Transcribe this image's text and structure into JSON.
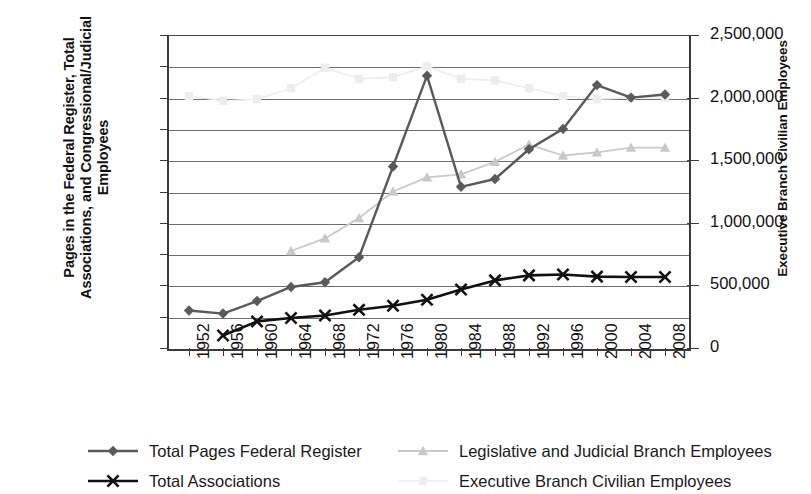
{
  "chart_data": {
    "type": "line",
    "title": "",
    "xlabel": "",
    "ylabel": "Pages in the Federal Register, Total Associations, and Congressional/Judicial Employees",
    "ylabel_right": "Executive Branch Civilian Employees",
    "x": [
      1952,
      1956,
      1960,
      1964,
      1968,
      1972,
      1976,
      1980,
      1984,
      1988,
      1992,
      1996,
      2000,
      2004,
      2008
    ],
    "xtick_labels": [
      "1952",
      "1956",
      "1960",
      "1964",
      "1968",
      "1972",
      "1976",
      "1980",
      "1984",
      "1988",
      "1992",
      "1996",
      "2000",
      "2004",
      "2008"
    ],
    "ylim": [
      0,
      100000
    ],
    "ytick_labels": [
      "0",
      "10,000",
      "20,000",
      "30,000",
      "40,000",
      "50,000",
      "60,000",
      "70,000",
      "80,000",
      "90,000",
      "100,000"
    ],
    "ytick_values": [
      0,
      10000,
      20000,
      30000,
      40000,
      50000,
      60000,
      70000,
      80000,
      90000,
      100000
    ],
    "ylim_right": [
      0,
      2500000
    ],
    "ytick_right_labels": [
      "0",
      "500,000",
      "1,000,000",
      "1,500,000",
      "2,000,000",
      "2,500,000"
    ],
    "ytick_right_values": [
      0,
      500000,
      1000000,
      1500000,
      2000000,
      2500000
    ],
    "grid": true,
    "legend_position": "bottom",
    "series": [
      {
        "name": "Total Pages Federal Register",
        "axis": "left",
        "color": "#5a5a5a",
        "marker": "diamond",
        "x": [
          1952,
          1956,
          1960,
          1964,
          1968,
          1972,
          1976,
          1980,
          1984,
          1988,
          1992,
          1996,
          2000,
          2004,
          2008
        ],
        "values": [
          12000,
          11000,
          15000,
          19500,
          21000,
          29000,
          58000,
          87000,
          51500,
          54000,
          63500,
          70000,
          84000,
          80000,
          81000
        ]
      },
      {
        "name": "Total Associations",
        "axis": "left",
        "color": "#111111",
        "marker": "x",
        "x": [
          1956,
          1960,
          1964,
          1968,
          1972,
          1976,
          1980,
          1984,
          1988,
          1992,
          1996,
          2000,
          2004,
          2008
        ],
        "values": [
          4000,
          8500,
          9600,
          10400,
          12200,
          13500,
          15400,
          18700,
          21600,
          23200,
          23500,
          22800,
          22700,
          22700
        ]
      },
      {
        "name": "Legislative and Judicial Branch Employees",
        "axis": "left",
        "color": "#c9c9c9",
        "marker": "triangle",
        "x": [
          1964,
          1968,
          1972,
          1976,
          1980,
          1984,
          1988,
          1992,
          1996,
          2000,
          2004,
          2008
        ],
        "values": [
          31000,
          35000,
          41500,
          50000,
          54500,
          55500,
          59500,
          65000,
          61500,
          62500,
          64000,
          64000
        ],
        "values_right_axis": [
          775000,
          875000,
          1037500,
          1250000,
          1362500,
          1387500,
          1487500,
          1625000,
          1537500,
          1562500,
          1600000,
          1600000
        ]
      },
      {
        "name": "Executive Branch Civilian Employees",
        "axis": "right",
        "color": "#ededed",
        "marker": "square",
        "x": [
          1952,
          1956,
          1960,
          1964,
          1968,
          1972,
          1976,
          1980,
          1984,
          1988,
          1992,
          1996,
          2000,
          2004,
          2008
        ],
        "values": [
          2550000,
          2400000,
          2400000,
          2500000,
          3000000,
          2800000,
          2850000,
          2900000,
          2950000,
          3100000,
          3050000,
          2800000,
          2700000,
          2700000,
          2700000
        ],
        "values_left_equiv": [
          80500,
          79000,
          79500,
          83000,
          89500,
          86000,
          86500,
          90000,
          86000,
          85500,
          83000,
          80500,
          79500,
          80000,
          80000
        ]
      }
    ]
  },
  "legend": {
    "items": [
      {
        "label": "Total Pages Federal Register",
        "marker": "diamond",
        "color": "#5a5a5a"
      },
      {
        "label": "Total Associations",
        "marker": "x",
        "color": "#111111"
      },
      {
        "label": "Legislative and Judicial Branch Employees",
        "marker": "triangle",
        "color": "#c9c9c9"
      },
      {
        "label": "Executive Branch Civilian Employees",
        "marker": "square",
        "color": "#ededed"
      }
    ]
  }
}
